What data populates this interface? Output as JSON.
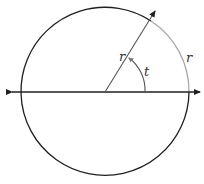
{
  "diagram": {
    "labels": {
      "radius": "r",
      "arc": "r",
      "angle": "t"
    },
    "colors": {
      "circle": "#1f1f1f",
      "arc_highlight": "#a8a8a8",
      "axis": "#1f1f1f",
      "ray": "#555555"
    }
  }
}
